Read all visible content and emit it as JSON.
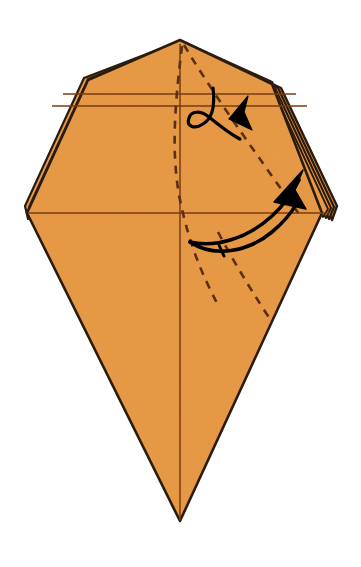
{
  "figure": {
    "kind": "origami-folding-diagram",
    "canvas": {
      "width": 361,
      "height": 567
    },
    "background_color": "#FFFFFF"
  },
  "colors": {
    "paper_fill": "#E89A45",
    "paper_fill_shade": "#E0903C",
    "outline": "#2B1A0E",
    "crease_line": "#7A3B12",
    "dashed_fold": "#5B2F15",
    "arrow": "#000000",
    "layer_gap": "#F3C68E"
  },
  "geometry": {
    "apex_top": {
      "x": 180,
      "y": 40
    },
    "corner_left": {
      "x": 27,
      "y": 213
    },
    "corner_right": {
      "x": 330,
      "y": 213
    },
    "apex_bottom": {
      "x": 180,
      "y": 522
    },
    "shoulder_left": {
      "x": 88,
      "y": 80
    },
    "shoulder_right": {
      "x": 272,
      "y": 82
    },
    "center_axis_x": 180
  },
  "creases": {
    "horizontal_upper": {
      "y": 94,
      "x1": 63,
      "x2": 296,
      "label": "upper-horizontal-crease"
    },
    "horizontal_lower": {
      "y": 106,
      "x1": 52,
      "x2": 307,
      "label": "lower-horizontal-crease"
    },
    "horizontal_waist": {
      "y": 213,
      "x1": 29,
      "x2": 329,
      "label": "waist-horizontal-crease"
    },
    "vertical_center": {
      "x": 180,
      "y1": 44,
      "y2": 520,
      "label": "vertical-center-crease"
    }
  },
  "dashed_folds": [
    {
      "name": "inner-dashed-fold",
      "points": "182,45 178,96 174,140 180,200 196,260 215,300",
      "note": "short dashed valley fold from apex curving down to mid-body"
    },
    {
      "name": "outer-dashed-fold",
      "points": "184,44 214,92 248,140 286,196 300,215",
      "note": "long dashed fold from apex to right corner"
    },
    {
      "name": "lower-dashed-fold",
      "points": "218,232 238,268 258,300 272,322",
      "note": "dashed continuation below the waist toward lower right edge"
    }
  ],
  "arrows": [
    {
      "name": "upper-hook-arrow",
      "kind": "curved-hook-arrow",
      "direction": "up-right",
      "tip": {
        "x": 246,
        "y": 108
      },
      "tail": {
        "x": 205,
        "y": 130
      },
      "note": "small hooked arrow indicating a small flap folded to the right"
    },
    {
      "name": "lower-sweep-arrow",
      "kind": "curved-sweep-arrow",
      "direction": "up-right",
      "tip": {
        "x": 298,
        "y": 198
      },
      "tail": {
        "x": 192,
        "y": 240
      },
      "note": "large sweeping arrow indicating the large flap swinging right"
    }
  ],
  "layers": {
    "right_edge_count": 4,
    "left_edge_count": 2,
    "note": "stacked paper layer lines visible along the upper-right and upper-left slanted edges"
  },
  "labels": {
    "step_number": "",
    "caption": ""
  }
}
